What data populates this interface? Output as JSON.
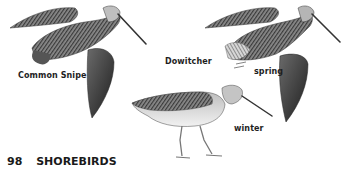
{
  "page": {
    "number": "98",
    "section_title": "SHOREBIRDS"
  },
  "illustrations": [
    {
      "name": "common-snipe",
      "label": "Common Snipe"
    },
    {
      "name": "dowitcher",
      "label": "Dowitcher"
    },
    {
      "name": "dowitcher-spring",
      "label": "spring"
    },
    {
      "name": "dowitcher-winter",
      "label": "winter"
    }
  ],
  "colors": {
    "ink": "#1e1e1e",
    "paper": "#ffffff",
    "plumage_dark": "#3a3a3a",
    "plumage_mid": "#7a7a7a",
    "plumage_light": "#c9c9c9"
  }
}
